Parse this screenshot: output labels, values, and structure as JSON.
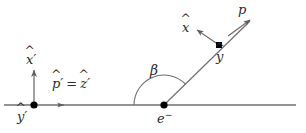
{
  "figure": {
    "type": "vector-diagram",
    "background_color": "#ffffff",
    "line_color": "#6b6b6b",
    "text_color": "#2b2b2b",
    "dot_color": "#000000",
    "width": 306,
    "height": 133
  },
  "labels": {
    "x_prime": {
      "base": "x",
      "hat": "^",
      "prime": "′"
    },
    "y_prime": {
      "base": "y",
      "hat": "^",
      "prime": "′"
    },
    "p_prime": {
      "base": "p",
      "hat": "^",
      "prime": "′"
    },
    "z_prime": {
      "base": "z",
      "hat": "^",
      "prime": "′"
    },
    "equals": "=",
    "beta": "β",
    "electron": {
      "base": "e",
      "sup": "−"
    },
    "x_hat": {
      "base": "x",
      "hat": "^"
    },
    "y_hat": {
      "base": "y",
      "hat": "^"
    },
    "p_hat": {
      "base": "p",
      "hat": "^"
    }
  },
  "geometry": {
    "horizontal_axis": {
      "x1": 4,
      "y1": 105,
      "x2": 296,
      "y2": 105
    },
    "primed_origin": {
      "x": 34,
      "y": 105
    },
    "x_prime_arrow": {
      "x1": 34,
      "y1": 105,
      "x2": 34,
      "y2": 69
    },
    "p_prime_tick": {
      "x": 62,
      "y": 105
    },
    "electron_vertex": {
      "x": 164,
      "y": 105
    },
    "scattered_line": {
      "x1": 164,
      "y1": 105,
      "x2": 249,
      "y2": 22
    },
    "y_hat_dot": {
      "x": 219,
      "y": 45
    },
    "p_hat_arrow": {
      "x1": 219,
      "y1": 45,
      "x2": 249,
      "y2": 21
    },
    "x_hat_arrow": {
      "x1": 219,
      "y1": 45,
      "x2": 196,
      "y2": 30
    },
    "beta_arc": {
      "cx": 164,
      "cy": 105,
      "radius": 30,
      "start_deg": 180,
      "end_deg": 44
    }
  }
}
